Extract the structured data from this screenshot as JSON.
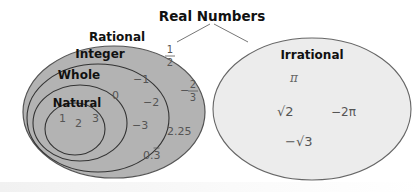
{
  "title": "Real Numbers",
  "sets": {
    "rational": {
      "label": "Rational",
      "fill": "#b0b0b0"
    },
    "integer": {
      "label": "Integer"
    },
    "whole": {
      "label": "Whole"
    },
    "natural": {
      "label": "Natural"
    },
    "irrational": {
      "label": "Irrational",
      "fill": "#ececec"
    }
  },
  "members": {
    "natural": [
      "1",
      "2",
      "3"
    ],
    "whole": [
      "0"
    ],
    "integer": [
      "−1",
      "−2",
      "−3"
    ],
    "rational": {
      "half_num": "1",
      "half_den": "2",
      "neg_sign": "−",
      "twothirds_num": "2",
      "twothirds_den": "3",
      "decimal": "2.25",
      "repeating": "0.3"
    },
    "irrational": {
      "pi": "π",
      "sqrt2": "√2",
      "neg2pi": "−2π",
      "negsqrt3": "−√3"
    }
  }
}
